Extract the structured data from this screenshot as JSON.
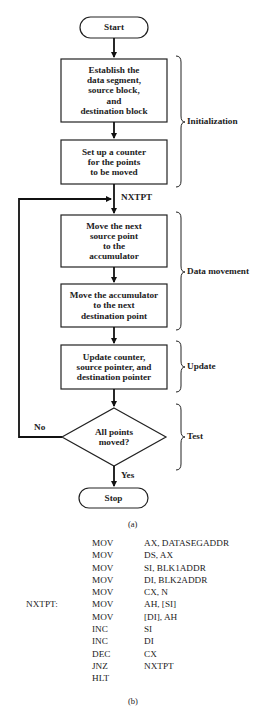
{
  "flowchart": {
    "start": "Start",
    "stop": "Stop",
    "steps": [
      {
        "id": "init-segments",
        "text": "Establish the\ndata segment,\nsource block,\nand\ndestination block"
      },
      {
        "id": "setup-counter",
        "text": "Set up a counter\nfor the points\nto be moved"
      },
      {
        "id": "move-source",
        "text": "Move the next\nsource point\nto the\naccumulator"
      },
      {
        "id": "move-dest",
        "text": "Move the accumulator\nto the next\ndestination point"
      },
      {
        "id": "update",
        "text": "Update counter,\nsource pointer, and\ndestination pointer"
      }
    ],
    "decision": {
      "text": "All points\nmoved?",
      "no_label": "No",
      "yes_label": "Yes"
    },
    "loop_label": "NXTPT",
    "groups": [
      {
        "label": "Initialization"
      },
      {
        "label": "Data movement"
      },
      {
        "label": "Update"
      },
      {
        "label": "Test"
      }
    ],
    "caption": "(a)"
  },
  "program": {
    "lines": [
      {
        "label": "",
        "op": "MOV",
        "arg": "AX, DATASEGADDR"
      },
      {
        "label": "",
        "op": "MOV",
        "arg": "DS, AX"
      },
      {
        "label": "",
        "op": "MOV",
        "arg": "SI, BLK1ADDR"
      },
      {
        "label": "",
        "op": "MOV",
        "arg": "DI, BLK2ADDR"
      },
      {
        "label": "",
        "op": "MOV",
        "arg": "CX, N"
      },
      {
        "label": "NXTPT:",
        "op": "MOV",
        "arg": "AH, [SI]"
      },
      {
        "label": "",
        "op": "MOV",
        "arg": "[DI], AH"
      },
      {
        "label": "",
        "op": "INC",
        "arg": "SI"
      },
      {
        "label": "",
        "op": "INC",
        "arg": "DI"
      },
      {
        "label": "",
        "op": "DEC",
        "arg": "CX"
      },
      {
        "label": "",
        "op": "JNZ",
        "arg": "NXTPT"
      },
      {
        "label": "",
        "op": "HLT",
        "arg": ""
      }
    ],
    "caption": "(b)"
  }
}
